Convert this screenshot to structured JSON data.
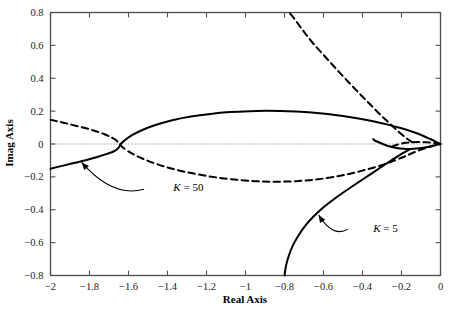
{
  "chart_data": {
    "type": "line",
    "title": "",
    "xlabel": "Real Axis",
    "ylabel": "Imag Axis",
    "xlim": [
      -2,
      0
    ],
    "ylim": [
      -0.8,
      0.8
    ],
    "xticks": [
      -2,
      -1.8,
      -1.6,
      -1.4,
      -1.2,
      -1,
      -0.8,
      -0.6,
      -0.4,
      -0.2,
      0
    ],
    "xtick_labels": [
      "-2",
      "-1.8",
      "-1.6",
      "-1.4",
      "-1.2",
      "-1",
      "-0.8",
      "-0.6",
      "-0.4",
      "-0.2",
      "0"
    ],
    "yticks": [
      -0.8,
      -0.6,
      -0.4,
      -0.2,
      0,
      0.2,
      0.4,
      0.6,
      0.8
    ],
    "ytick_labels": [
      "-0.8",
      "-0.6",
      "-0.4",
      "-0.2",
      "0",
      "0.2",
      "0.4",
      "0.6",
      "0.8"
    ],
    "grid": false,
    "zero_line": true,
    "legend_position": "none",
    "series": [
      {
        "name": "K = 5",
        "style": "solid",
        "color": "#000000",
        "width": 2.0,
        "points": [
          [
            -2.0,
            -0.15
          ],
          [
            -1.94,
            -0.133
          ],
          [
            -1.88,
            -0.116
          ],
          [
            -1.82,
            -0.099
          ],
          [
            -1.76,
            -0.079
          ],
          [
            -1.71,
            -0.06
          ],
          [
            -1.674,
            -0.044
          ],
          [
            -1.655,
            -0.028
          ],
          [
            -1.645,
            -0.013
          ],
          [
            -1.64,
            0.0
          ],
          [
            -1.62,
            0.022
          ],
          [
            -1.58,
            0.055
          ],
          [
            -1.52,
            0.09
          ],
          [
            -1.45,
            0.12
          ],
          [
            -1.37,
            0.146
          ],
          [
            -1.28,
            0.167
          ],
          [
            -1.18,
            0.183
          ],
          [
            -1.08,
            0.194
          ],
          [
            -0.98,
            0.2
          ],
          [
            -0.9,
            0.202
          ],
          [
            -0.82,
            0.201
          ],
          [
            -0.74,
            0.197
          ],
          [
            -0.66,
            0.191
          ],
          [
            -0.58,
            0.182
          ],
          [
            -0.5,
            0.17
          ],
          [
            -0.42,
            0.155
          ],
          [
            -0.34,
            0.137
          ],
          [
            -0.27,
            0.118
          ],
          [
            -0.2,
            0.096
          ],
          [
            -0.14,
            0.073
          ],
          [
            -0.09,
            0.05
          ],
          [
            -0.05,
            0.029
          ],
          [
            -0.02,
            0.012
          ],
          [
            0.0,
            0.0
          ]
        ]
      },
      {
        "name": "K = 5 lower branch",
        "style": "solid",
        "color": "#000000",
        "width": 2.0,
        "points": [
          [
            0.0,
            0.0
          ],
          [
            -0.04,
            -0.012
          ],
          [
            -0.08,
            -0.021
          ],
          [
            -0.12,
            -0.027
          ],
          [
            -0.155,
            -0.03
          ],
          [
            -0.19,
            -0.029
          ],
          [
            -0.225,
            -0.024
          ],
          [
            -0.26,
            -0.015
          ],
          [
            -0.29,
            -0.003
          ],
          [
            -0.32,
            0.012
          ],
          [
            -0.34,
            0.024
          ],
          [
            -0.345,
            0.03
          ]
        ]
      },
      {
        "name": "K = 5 descending branch",
        "style": "solid",
        "color": "#000000",
        "width": 2.0,
        "points": [
          [
            -0.155,
            -0.03
          ],
          [
            -0.2,
            -0.06
          ],
          [
            -0.25,
            -0.098
          ],
          [
            -0.3,
            -0.137
          ],
          [
            -0.36,
            -0.185
          ],
          [
            -0.42,
            -0.232
          ],
          [
            -0.48,
            -0.28
          ],
          [
            -0.54,
            -0.33
          ],
          [
            -0.6,
            -0.385
          ],
          [
            -0.65,
            -0.44
          ],
          [
            -0.695,
            -0.5
          ],
          [
            -0.73,
            -0.56
          ],
          [
            -0.758,
            -0.62
          ],
          [
            -0.778,
            -0.68
          ],
          [
            -0.792,
            -0.74
          ],
          [
            -0.8,
            -0.8
          ]
        ]
      },
      {
        "name": "K = 50",
        "style": "dashed",
        "color": "#000000",
        "width": 2.0,
        "points": [
          [
            -2.0,
            0.148
          ],
          [
            -1.95,
            0.134
          ],
          [
            -1.9,
            0.12
          ],
          [
            -1.85,
            0.105
          ],
          [
            -1.8,
            0.09
          ],
          [
            -1.76,
            0.075
          ],
          [
            -1.72,
            0.058
          ],
          [
            -1.69,
            0.042
          ],
          [
            -1.665,
            0.024
          ],
          [
            -1.652,
            0.01
          ],
          [
            -1.646,
            0.0
          ],
          [
            -1.63,
            -0.02
          ],
          [
            -1.6,
            -0.045
          ],
          [
            -1.56,
            -0.072
          ],
          [
            -1.51,
            -0.098
          ],
          [
            -1.45,
            -0.124
          ],
          [
            -1.38,
            -0.149
          ],
          [
            -1.3,
            -0.172
          ],
          [
            -1.21,
            -0.192
          ],
          [
            -1.12,
            -0.208
          ],
          [
            -1.03,
            -0.219
          ],
          [
            -0.95,
            -0.226
          ],
          [
            -0.88,
            -0.229
          ],
          [
            -0.81,
            -0.229
          ],
          [
            -0.74,
            -0.226
          ],
          [
            -0.67,
            -0.22
          ],
          [
            -0.6,
            -0.21
          ],
          [
            -0.53,
            -0.197
          ],
          [
            -0.47,
            -0.182
          ],
          [
            -0.41,
            -0.165
          ],
          [
            -0.35,
            -0.146
          ],
          [
            -0.29,
            -0.124
          ],
          [
            -0.24,
            -0.102
          ],
          [
            -0.19,
            -0.079
          ],
          [
            -0.15,
            -0.058
          ],
          [
            -0.11,
            -0.039
          ],
          [
            -0.07,
            -0.023
          ],
          [
            -0.04,
            -0.011
          ],
          [
            -0.015,
            -0.004
          ],
          [
            0.0,
            0.0
          ]
        ]
      },
      {
        "name": "K = 50 upper branch",
        "style": "dashed",
        "color": "#000000",
        "width": 2.0,
        "points": [
          [
            0.0,
            0.0
          ],
          [
            -0.03,
            0.006
          ],
          [
            -0.07,
            0.01
          ],
          [
            -0.11,
            0.012
          ],
          [
            -0.145,
            0.011
          ],
          [
            -0.18,
            0.007
          ],
          [
            -0.21,
            0.0
          ],
          [
            -0.235,
            -0.009
          ],
          [
            -0.25,
            -0.017
          ]
        ]
      },
      {
        "name": "K = 50 ascending branch",
        "style": "dashed",
        "color": "#000000",
        "width": 2.0,
        "points": [
          [
            -0.145,
            0.011
          ],
          [
            -0.18,
            0.04
          ],
          [
            -0.22,
            0.08
          ],
          [
            -0.26,
            0.125
          ],
          [
            -0.31,
            0.18
          ],
          [
            -0.36,
            0.24
          ],
          [
            -0.41,
            0.3
          ],
          [
            -0.46,
            0.362
          ],
          [
            -0.51,
            0.425
          ],
          [
            -0.56,
            0.49
          ],
          [
            -0.61,
            0.555
          ],
          [
            -0.66,
            0.622
          ],
          [
            -0.705,
            0.69
          ],
          [
            -0.745,
            0.755
          ],
          [
            -0.775,
            0.8
          ]
        ]
      }
    ],
    "annotations": [
      {
        "id": "annot-k50",
        "label_prefix": "K",
        "label_suffix": " = 50",
        "text": "K = 50",
        "text_x": -1.37,
        "text_y": -0.265,
        "arrow_from_x": -1.52,
        "arrow_from_y": -0.275,
        "arrow_to_x": -1.84,
        "arrow_to_y": -0.112
      },
      {
        "id": "annot-k5",
        "label_prefix": "K",
        "label_suffix": " = 5",
        "text": "K = 5",
        "text_x": -0.345,
        "text_y": -0.512,
        "arrow_from_x": -0.475,
        "arrow_from_y": -0.518,
        "arrow_to_x": -0.625,
        "arrow_to_y": -0.432
      }
    ]
  }
}
